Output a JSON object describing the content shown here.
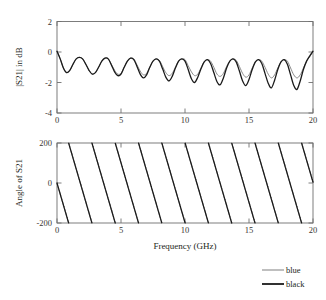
{
  "chart_data": [
    {
      "type": "line",
      "id": "magnitude-plot",
      "title": "",
      "xlabel": "",
      "ylabel": "|S21| in dB",
      "xlim": [
        0,
        20
      ],
      "ylim": [
        -4,
        2
      ],
      "xticks": [
        0,
        5,
        10,
        15,
        20
      ],
      "xticklabels": [
        "0",
        "5",
        "10",
        "15",
        "20"
      ],
      "yticks": [
        2,
        0,
        -2,
        -4
      ],
      "yticklabels": [
        "2",
        "0",
        "-2",
        "-4"
      ],
      "grid": false,
      "legend_position": "outside-bottom-right",
      "series": [
        {
          "name": "blue",
          "color": "#8a8a8a",
          "linewidth": 1.0,
          "x": [
            0.0,
            0.25,
            0.5,
            0.75,
            1.0,
            1.25,
            1.5,
            1.75,
            2.0,
            2.25,
            2.5,
            2.75,
            3.0,
            3.25,
            3.5,
            3.75,
            4.0,
            4.25,
            4.5,
            4.75,
            5.0,
            5.25,
            5.5,
            5.75,
            6.0,
            6.25,
            6.5,
            6.75,
            7.0,
            7.25,
            7.5,
            7.75,
            8.0,
            8.25,
            8.5,
            8.75,
            9.0,
            9.25,
            9.5,
            9.75,
            10.0,
            10.25,
            10.5,
            10.75,
            11.0,
            11.25,
            11.5,
            11.75,
            12.0,
            12.25,
            12.5,
            12.75,
            13.0,
            13.25,
            13.5,
            13.75,
            14.0,
            14.25,
            14.5,
            14.75,
            15.0,
            15.25,
            15.5,
            15.75,
            16.0,
            16.25,
            16.5,
            16.75,
            17.0,
            17.25,
            17.5,
            17.75,
            18.0,
            18.25,
            18.5,
            18.75,
            19.0,
            19.25,
            19.5,
            19.75,
            20.0
          ],
          "y": [
            0.05,
            -0.45,
            -1.05,
            -1.35,
            -1.2,
            -0.8,
            -0.45,
            -0.35,
            -0.45,
            -0.8,
            -1.2,
            -1.45,
            -1.35,
            -1.0,
            -0.6,
            -0.4,
            -0.45,
            -0.8,
            -1.2,
            -1.45,
            -1.4,
            -1.0,
            -0.6,
            -0.4,
            -0.45,
            -0.85,
            -1.25,
            -1.5,
            -1.4,
            -1.0,
            -0.6,
            -0.45,
            -0.55,
            -0.95,
            -1.35,
            -1.55,
            -1.4,
            -1.0,
            -0.6,
            -0.45,
            -0.5,
            -0.9,
            -1.3,
            -1.55,
            -1.45,
            -1.05,
            -0.65,
            -0.5,
            -0.6,
            -1.0,
            -1.45,
            -1.6,
            -1.4,
            -0.95,
            -0.6,
            -0.45,
            -0.55,
            -0.95,
            -1.4,
            -1.65,
            -1.5,
            -1.05,
            -0.65,
            -0.5,
            -0.6,
            -1.0,
            -1.45,
            -1.7,
            -1.5,
            -1.05,
            -0.65,
            -0.5,
            -0.6,
            -1.05,
            -1.5,
            -1.7,
            -1.5,
            -1.05,
            -0.6,
            -0.3,
            0.0
          ]
        },
        {
          "name": "black",
          "color": "#1a1a1a",
          "linewidth": 1.3,
          "x": [
            0.0,
            0.25,
            0.5,
            0.75,
            1.0,
            1.25,
            1.5,
            1.75,
            2.0,
            2.25,
            2.5,
            2.75,
            3.0,
            3.25,
            3.5,
            3.75,
            4.0,
            4.25,
            4.5,
            4.75,
            5.0,
            5.25,
            5.5,
            5.75,
            6.0,
            6.25,
            6.5,
            6.75,
            7.0,
            7.25,
            7.5,
            7.75,
            8.0,
            8.25,
            8.5,
            8.75,
            9.0,
            9.25,
            9.5,
            9.75,
            10.0,
            10.25,
            10.5,
            10.75,
            11.0,
            11.25,
            11.5,
            11.75,
            12.0,
            12.25,
            12.5,
            12.75,
            13.0,
            13.25,
            13.5,
            13.75,
            14.0,
            14.25,
            14.5,
            14.75,
            15.0,
            15.25,
            15.5,
            15.75,
            16.0,
            16.25,
            16.5,
            16.75,
            17.0,
            17.25,
            17.5,
            17.75,
            18.0,
            18.25,
            18.5,
            18.75,
            19.0,
            19.25,
            19.5,
            19.75,
            20.0
          ],
          "y": [
            0.05,
            -0.45,
            -1.05,
            -1.35,
            -1.2,
            -0.8,
            -0.45,
            -0.35,
            -0.45,
            -0.8,
            -1.2,
            -1.45,
            -1.35,
            -1.0,
            -0.6,
            -0.4,
            -0.45,
            -0.85,
            -1.3,
            -1.55,
            -1.45,
            -1.0,
            -0.6,
            -0.4,
            -0.5,
            -0.95,
            -1.45,
            -1.7,
            -1.5,
            -1.0,
            -0.6,
            -0.45,
            -0.6,
            -1.1,
            -1.65,
            -1.9,
            -1.6,
            -1.05,
            -0.6,
            -0.45,
            -0.6,
            -1.15,
            -1.75,
            -2.0,
            -1.65,
            -1.1,
            -0.65,
            -0.5,
            -0.75,
            -1.35,
            -1.95,
            -2.15,
            -1.7,
            -1.05,
            -0.6,
            -0.45,
            -0.65,
            -1.25,
            -1.9,
            -2.2,
            -1.8,
            -1.15,
            -0.65,
            -0.5,
            -0.75,
            -1.4,
            -2.05,
            -2.35,
            -1.85,
            -1.15,
            -0.65,
            -0.5,
            -0.8,
            -1.5,
            -2.2,
            -2.45,
            -1.9,
            -1.15,
            -0.6,
            -0.25,
            0.05
          ]
        }
      ]
    },
    {
      "type": "line",
      "id": "phase-plot",
      "title": "",
      "xlabel": "Frequency (GHz)",
      "ylabel": "Angle of S21",
      "xlim": [
        0,
        20
      ],
      "ylim": [
        -200,
        200
      ],
      "xticks": [
        0,
        5,
        10,
        15,
        20
      ],
      "xticklabels": [
        "0",
        "5",
        "10",
        "15",
        "20"
      ],
      "yticks": [
        200,
        0,
        -200
      ],
      "yticklabels": [
        "200",
        "0",
        "-200"
      ],
      "grid": false,
      "sawtooth": {
        "start_value": 0,
        "period_ghz": 1.82,
        "wrap_high": 200,
        "wrap_low": -200,
        "direction": "decreasing",
        "cycles": 11
      },
      "series": [
        {
          "name": "blue",
          "color": "#8a8a8a",
          "linewidth": 1.0
        },
        {
          "name": "black",
          "color": "#1a1a1a",
          "linewidth": 1.3
        }
      ]
    }
  ],
  "legend": {
    "items": [
      {
        "label": "blue",
        "color": "#8a8a8a",
        "linewidth": 1.1
      },
      {
        "label": "black",
        "color": "#1a1a1a",
        "linewidth": 1.8
      }
    ]
  },
  "axis_color": "#6f6f6f",
  "background": "#ffffff"
}
